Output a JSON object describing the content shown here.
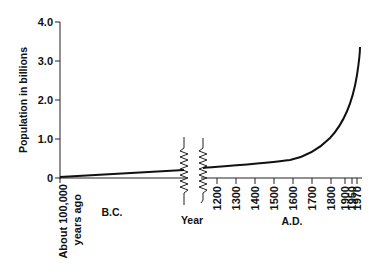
{
  "chart_data": {
    "type": "line",
    "title": "",
    "xlabel": "Year",
    "ylabel": "Population in billions",
    "ylim": [
      0,
      4.0
    ],
    "y_ticks": [
      "0",
      "1.0",
      "2.0",
      "3.0",
      "4.0"
    ],
    "x_tick_labels": {
      "start": "About 100,000 years ago",
      "ad": [
        "1200",
        "1300",
        "1400",
        "1500",
        "1600",
        "1700",
        "1800",
        "1900",
        "1950",
        "1970"
      ]
    },
    "era_labels": {
      "bc": "B.C.",
      "ad": "A.D."
    },
    "axis_break": "between B.C. segment and 1200 A.D.",
    "grid": false,
    "legend": null,
    "series": [
      {
        "name": "World population",
        "points": [
          {
            "x": "About 100,000 years ago",
            "y": 0.01
          },
          {
            "x": "End of B.C.",
            "y": 0.25
          },
          {
            "x": "1200",
            "y": 0.35
          },
          {
            "x": "1300",
            "y": 0.38
          },
          {
            "x": "1400",
            "y": 0.42
          },
          {
            "x": "1500",
            "y": 0.46
          },
          {
            "x": "1600",
            "y": 0.55
          },
          {
            "x": "1700",
            "y": 0.75
          },
          {
            "x": "1800",
            "y": 1.1
          },
          {
            "x": "1900",
            "y": 1.8
          },
          {
            "x": "1950",
            "y": 2.5
          },
          {
            "x": "1970",
            "y": 3.35
          }
        ]
      }
    ]
  },
  "axes": {
    "y_ticks": [
      {
        "label": "0",
        "y": 178
      },
      {
        "label": "1.0",
        "y": 139
      },
      {
        "label": "2.0",
        "y": 100
      },
      {
        "label": "3.0",
        "y": 61
      },
      {
        "label": "4.0",
        "y": 22
      }
    ],
    "ylabel": "Population in billions",
    "xlabel": "Year",
    "start_label_line1": "About 100,000",
    "start_label_line2": "years ago",
    "bc_label": "B.C.",
    "ad_label": "A.D.",
    "ad_ticks": [
      {
        "label": "1200",
        "x": 217
      },
      {
        "label": "1300",
        "x": 236
      },
      {
        "label": "1400",
        "x": 255
      },
      {
        "label": "1500",
        "x": 274
      },
      {
        "label": "1600",
        "x": 293
      },
      {
        "label": "1700",
        "x": 312
      },
      {
        "label": "1800",
        "x": 331
      },
      {
        "label": "1900",
        "x": 345
      },
      {
        "label": "1950",
        "x": 352
      },
      {
        "label": "1970",
        "x": 357
      }
    ]
  },
  "colors": {
    "line": "#111111",
    "background": "#ffffff"
  }
}
